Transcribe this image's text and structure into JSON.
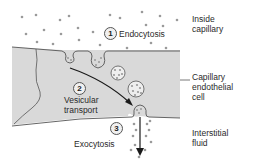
{
  "labels": {
    "inside_capillary": [
      "Inside",
      "capillary"
    ],
    "endothelial_cell": [
      "Capillary",
      "endothelial",
      "cell"
    ],
    "interstitial_fluid": [
      "Interstitial",
      "fluid"
    ]
  },
  "steps": [
    {
      "number": "1",
      "label": "Endocytosis"
    },
    {
      "number": "2",
      "label": "Vesicular transport",
      "lines": [
        "Vesicular",
        "transport"
      ]
    },
    {
      "number": "3",
      "label": "Exocytosis"
    }
  ],
  "colors": {
    "cell_fill": "#d9d9d9",
    "cell_outline": "#555555",
    "particle": "#9a9a9a",
    "arrow": "#1a1a1a",
    "text": "#2a2a2a"
  }
}
